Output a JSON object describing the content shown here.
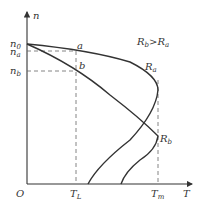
{
  "diagram": {
    "type": "motor-mechanical-characteristic",
    "axes": {
      "y_label": "n",
      "x_label": "T",
      "origin_label": "O"
    },
    "y_ticks": [
      {
        "label": "n",
        "sub": "0",
        "y": 44
      },
      {
        "label": "n",
        "sub": "a",
        "y": 51
      },
      {
        "label": "n",
        "sub": "b",
        "y": 71
      }
    ],
    "x_ticks": [
      {
        "label": "T",
        "sub": "L",
        "x": 76
      },
      {
        "label": "T",
        "sub": "m",
        "x": 158
      }
    ],
    "points": [
      {
        "label": "a"
      },
      {
        "label": "b"
      }
    ],
    "curves": [
      {
        "label": "R",
        "sub": "a"
      },
      {
        "label": "R",
        "sub": "b"
      }
    ],
    "condition": {
      "left": "R",
      "left_sub": "b",
      "op": ">",
      "right": "R",
      "right_sub": "a"
    }
  }
}
